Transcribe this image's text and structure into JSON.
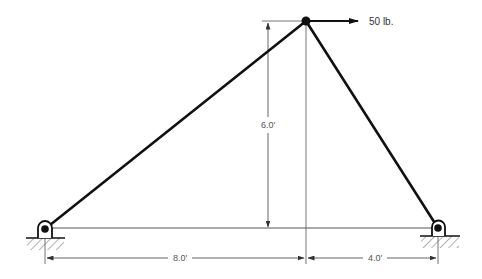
{
  "diagram": {
    "type": "truss-structure",
    "colors": {
      "member": "#111111",
      "dimension": "#555555",
      "background": "#ffffff"
    },
    "nodes": {
      "top_joint": {
        "x": 306,
        "y": 21
      },
      "left_support": {
        "x": 45,
        "y": 229
      },
      "right_support": {
        "x": 438,
        "y": 228
      }
    },
    "load": {
      "label": "50 lb.",
      "direction": "right"
    },
    "dimensions": {
      "height": "6.0'",
      "left_span": "8.0'",
      "right_span": "4.0'"
    },
    "supports": [
      {
        "name": "left",
        "type": "pin"
      },
      {
        "name": "right",
        "type": "pin"
      }
    ]
  }
}
